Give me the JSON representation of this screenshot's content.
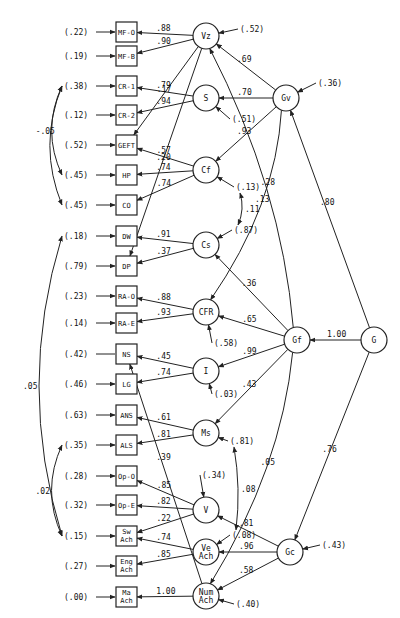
{
  "diagram": {
    "observed": [
      {
        "id": "MF-O",
        "label": "MF-O",
        "error": "(.22)"
      },
      {
        "id": "MF-B",
        "label": "MF-B",
        "error": "(.19)"
      },
      {
        "id": "CR-1",
        "label": "CR-1",
        "error": "(.38)"
      },
      {
        "id": "CR-2",
        "label": "CR-2",
        "error": "(.12)"
      },
      {
        "id": "GEFT",
        "label": "GEFT",
        "error": "(.52)"
      },
      {
        "id": "HP",
        "label": "HP",
        "error": "(.45)"
      },
      {
        "id": "CO",
        "label": "CO",
        "error": "(.45)"
      },
      {
        "id": "DW",
        "label": "DW",
        "error": "(.18)"
      },
      {
        "id": "DP",
        "label": "DP",
        "error": "(.79)"
      },
      {
        "id": "RA-O",
        "label": "RA-O",
        "error": "(.23)"
      },
      {
        "id": "RA-E",
        "label": "RA-E",
        "error": "(.14)"
      },
      {
        "id": "NS",
        "label": "NS",
        "error": "(.42)"
      },
      {
        "id": "LG",
        "label": "LG",
        "error": "(.46)"
      },
      {
        "id": "ANS",
        "label": "ANS",
        "error": "(.63)"
      },
      {
        "id": "ALS",
        "label": "ALS",
        "error": "(.35)"
      },
      {
        "id": "Op-O",
        "label": "Op-O",
        "error": "(.28)"
      },
      {
        "id": "Op-E",
        "label": "Op-E",
        "error": "(.32)"
      },
      {
        "id": "SwAch",
        "label": "Sw Ach",
        "error": "(.15)"
      },
      {
        "id": "EngAch",
        "label": "Eng Ach",
        "error": "(.27)"
      },
      {
        "id": "MaAch",
        "label": "Ma Ach",
        "error": "(.00)"
      }
    ],
    "latent": [
      {
        "id": "Vz",
        "label": "Vz",
        "error": "(.52)"
      },
      {
        "id": "S",
        "label": "S",
        "error": "(.51)"
      },
      {
        "id": "Cf",
        "label": "Cf",
        "error": "(.13)"
      },
      {
        "id": "Cs",
        "label": "Cs",
        "error": "(.87)"
      },
      {
        "id": "CFR",
        "label": "CFR",
        "error": "(.58)"
      },
      {
        "id": "I",
        "label": "I",
        "error": "(.03)"
      },
      {
        "id": "Ms",
        "label": "Ms",
        "error": "(.81)"
      },
      {
        "id": "V",
        "label": "V",
        "error": "(.34)"
      },
      {
        "id": "VeAch",
        "label": "Ve Ach",
        "error": "(.08)"
      },
      {
        "id": "NumAch",
        "label": "Num Ach",
        "error": "(.40)"
      },
      {
        "id": "Gv",
        "label": "Gv",
        "error": "(.36)"
      },
      {
        "id": "Gf",
        "label": "Gf",
        "error": ""
      },
      {
        "id": "Gc",
        "label": "Gc",
        "error": "(.43)"
      },
      {
        "id": "G",
        "label": "G",
        "error": ""
      }
    ],
    "loadings": [
      {
        "from": "Vz",
        "to": "MF-O",
        "value": ".88"
      },
      {
        "from": "Vz",
        "to": "MF-B",
        "value": ".90"
      },
      {
        "from": "Vz",
        "to": "GEFT",
        "value": ".17"
      },
      {
        "from": "Vz",
        "to": "DP",
        "value": ".20"
      },
      {
        "from": "S",
        "to": "CR-1",
        "value": ".79"
      },
      {
        "from": "S",
        "to": "CR-2",
        "value": ".94"
      },
      {
        "from": "Cf",
        "to": "GEFT",
        "value": ".57"
      },
      {
        "from": "Cf",
        "to": "HP",
        "value": ".74"
      },
      {
        "from": "Cf",
        "to": "CO",
        "value": ".74"
      },
      {
        "from": "Cs",
        "to": "DW",
        "value": ".91"
      },
      {
        "from": "Cs",
        "to": "DP",
        "value": ".37"
      },
      {
        "from": "CFR",
        "to": "RA-O",
        "value": ".88"
      },
      {
        "from": "CFR",
        "to": "RA-E",
        "value": ".93"
      },
      {
        "from": "I",
        "to": "NS",
        "value": ".45"
      },
      {
        "from": "I",
        "to": "LG",
        "value": ".74"
      },
      {
        "from": "Ms",
        "to": "ANS",
        "value": ".61"
      },
      {
        "from": "Ms",
        "to": "ALS",
        "value": ".81"
      },
      {
        "from": "V",
        "to": "Op-O",
        "value": ".85"
      },
      {
        "from": "V",
        "to": "Op-E",
        "value": ".82"
      },
      {
        "from": "V",
        "to": "SwAch",
        "value": ".22"
      },
      {
        "from": "VeAch",
        "to": "SwAch",
        "value": ".74"
      },
      {
        "from": "VeAch",
        "to": "EngAch",
        "value": ".85"
      },
      {
        "from": "NumAch",
        "to": "MaAch",
        "value": "1.00"
      },
      {
        "from": "NumAch",
        "to": "NS",
        "value": ".39"
      },
      {
        "from": "Gv",
        "to": "Vz",
        "value": ".69"
      },
      {
        "from": "Gv",
        "to": "S",
        "value": ".70"
      },
      {
        "from": "Gv",
        "to": "Cf",
        "value": ".93"
      },
      {
        "from": "Gv",
        "to": "CFR",
        "value": ".13"
      },
      {
        "from": "Gf",
        "to": "Cs",
        "value": ".36"
      },
      {
        "from": "Gf",
        "to": "CFR",
        "value": ".65"
      },
      {
        "from": "Gf",
        "to": "I",
        "value": ".99"
      },
      {
        "from": "Gf",
        "to": "Ms",
        "value": ".43"
      },
      {
        "from": "Gf",
        "to": "Vz",
        "value": ".28"
      },
      {
        "from": "Gf",
        "to": "NumAch",
        "value": ".05"
      },
      {
        "from": "Gc",
        "to": "V",
        "value": ".81"
      },
      {
        "from": "Gc",
        "to": "VeAch",
        "value": ".96"
      },
      {
        "from": "Gc",
        "to": "NumAch",
        "value": ".58"
      },
      {
        "from": "G",
        "to": "Gf",
        "value": "1.00"
      },
      {
        "from": "G",
        "to": "Gv",
        "value": ".80"
      },
      {
        "from": "G",
        "to": "Gc",
        "value": ".76"
      }
    ],
    "correlations": [
      {
        "between": [
          "CR-1",
          "HP"
        ],
        "value": "-.05"
      },
      {
        "between": [
          "CR-1",
          "CO"
        ],
        "value": ""
      },
      {
        "between": [
          "DW",
          "SwAch"
        ],
        "value": ".05"
      },
      {
        "between": [
          "ALS",
          "SwAch"
        ],
        "value": ".02"
      },
      {
        "between": [
          "Cf",
          "Cs"
        ],
        "value": ".11"
      },
      {
        "between": [
          "Ms",
          "VeAch"
        ],
        "value": ".08"
      }
    ]
  }
}
